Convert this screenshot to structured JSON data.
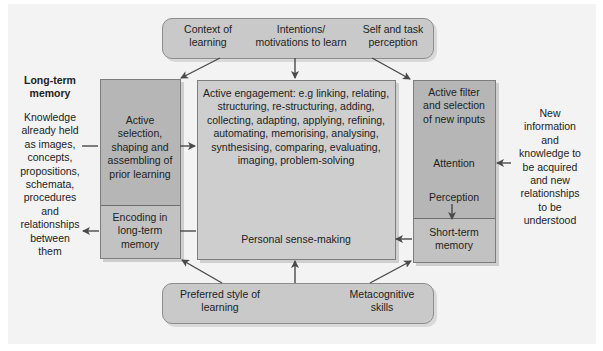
{
  "top_bar": {
    "items": [
      "Context of\nlearning",
      "Intentions/\nmotivations to learn",
      "Self and task\nperception"
    ],
    "item_0_l1": "Context of",
    "item_0_l2": "learning",
    "item_1_l1": "Intentions/",
    "item_1_l2": "motivations to learn",
    "item_2_l1": "Self and task",
    "item_2_l2": "perception"
  },
  "bottom_bar": {
    "item_0_l1": "Preferred style of",
    "item_0_l2": "learning",
    "item_1_l1": "Metacognitive",
    "item_1_l2": "skills"
  },
  "long_term_memory": {
    "title_l1": "Long-term",
    "title_l2": "memory",
    "lines": [
      "Knowledge",
      "already held",
      "as images,",
      "concepts,",
      "propositions,",
      "schemata,",
      "procedures",
      "and",
      "relationships",
      "between",
      "them"
    ]
  },
  "left_box": {
    "upper_lines": [
      "Active",
      "selection,",
      "shaping and",
      "assembling of",
      "prior learning"
    ],
    "lower_lines": [
      "Encoding in",
      "long-term",
      "memory"
    ]
  },
  "center_box": {
    "engagement_lines": [
      "Active engagement: e.g linking, relating,",
      "structuring, re-structuring, adding,",
      "collecting, adapting, applying, refining,",
      "automating, memorising, analysing,",
      "synthesising, comparing, evaluating,",
      "imaging, problem-solving"
    ],
    "sense_making": "Personal sense-making"
  },
  "right_box": {
    "filter_lines": [
      "Active filter",
      "and selection",
      "of new inputs"
    ],
    "attention": "Attention",
    "perception": "Perception",
    "lower_lines": [
      "Short-term",
      "memory"
    ]
  },
  "new_information": {
    "lines": [
      "New",
      "information",
      "and",
      "knowledge to",
      "be acquired",
      "and new",
      "relationships",
      "to be",
      "understood"
    ]
  },
  "colors": {
    "background": "#f3f3f3",
    "pill_fill": "#c9c9c9",
    "box_dark": "#b6b6b6",
    "box_light": "#cecece",
    "arrow": "#4a4a4a"
  }
}
